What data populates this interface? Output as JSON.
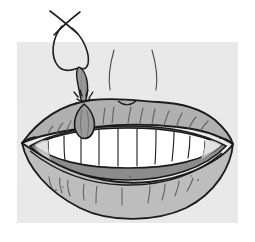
{
  "image": {
    "title": "Tooth extraction with string",
    "subject": "mouth-with-lips-and-teeth",
    "style": "line-art-illustration",
    "caption": "",
    "canvas": {
      "width": 255,
      "height": 242
    }
  },
  "palette": {
    "page_background": "#ffffff",
    "panel_background": "#e9e9e9",
    "lip_fill": "#b4b4b4",
    "lip_upper_fill": "#b0b0b0",
    "lip_lower_fill": "#bdbdbd",
    "tooth_fill": "#ffffff",
    "tooth_shadow": "#d9d9d9",
    "mouth_shadow": "#8c8c8c",
    "extracted_tooth_fill": "#9a9a9a",
    "outline": "#1a1a1a",
    "thread": "#1f1f1f",
    "texture_line": "#555555"
  },
  "panel": {
    "name": "background-panel",
    "x": 17,
    "y": 42,
    "width": 221,
    "height": 181
  },
  "elements": {
    "thread": {
      "name": "extraction-thread",
      "label": "string loop",
      "crossing_point": {
        "x": 66,
        "y": 20
      },
      "loop_top": {
        "x": 63,
        "y": 32
      },
      "loop_bottom": {
        "x": 80,
        "y": 68
      }
    },
    "extracted_tooth": {
      "name": "extracted-tooth",
      "label": "extracted tooth",
      "root_top": {
        "x": 80,
        "y": 68
      },
      "knot": {
        "x": 84,
        "y": 103
      },
      "crown_bottom": {
        "x": 85,
        "y": 138
      }
    },
    "upper_lip": {
      "name": "upper-lip",
      "label": "upper lip"
    },
    "lower_lip": {
      "name": "lower-lip",
      "label": "lower lip"
    },
    "teeth_row": {
      "name": "upper-teeth-row",
      "label": "upper teeth",
      "count": 10,
      "divider_x": [
        58,
        75,
        92,
        108,
        125,
        142,
        158,
        173,
        188
      ]
    },
    "mouth_interior": {
      "name": "mouth-interior-shadow",
      "label": "mouth shadow"
    },
    "philtrum_lines": {
      "name": "philtrum-lines",
      "label": "philtrum lines",
      "count": 2
    }
  }
}
